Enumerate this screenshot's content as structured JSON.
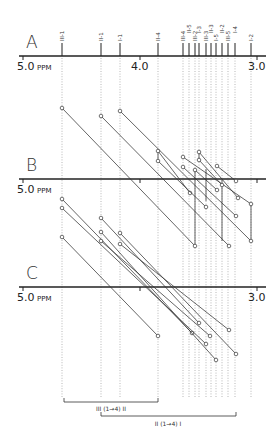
{
  "panels": [
    {
      "letter": "A",
      "axis_y": 56,
      "label_y": 48,
      "left_label": "5.0",
      "left_unit": "PPM",
      "mid_label": "4.0",
      "right_label": "3.0"
    },
    {
      "letter": "B",
      "axis_y": 179,
      "label_y": 171,
      "left_label": "5.0",
      "left_unit": "PPM",
      "mid_label": "",
      "right_label": ""
    },
    {
      "letter": "C",
      "axis_y": 287,
      "label_y": 279,
      "left_label": "5.0",
      "left_unit": "PPM",
      "mid_label": "",
      "right_label": "3.0"
    }
  ],
  "axis": {
    "x_start": 19,
    "x_end": 266,
    "ppm_5_x": 23,
    "ppm_4_x": 140,
    "ppm_3_x": 257
  },
  "peaks": [
    {
      "label": "III-1",
      "x": 62
    },
    {
      "label": "II-1",
      "x": 101
    },
    {
      "label": "I-1",
      "x": 120
    },
    {
      "label": "II-4",
      "x": 158
    },
    {
      "label": "III-4",
      "x": 183
    },
    {
      "label": "II-5",
      "x": 189
    },
    {
      "label": "III-2",
      "x": 195
    },
    {
      "label": "I-3",
      "x": 199
    },
    {
      "label": "III-3",
      "x": 206
    },
    {
      "label": "II-3",
      "x": 211
    },
    {
      "label": "I-5",
      "x": 216
    },
    {
      "label": "II-2",
      "x": 222
    },
    {
      "label": "III-5",
      "x": 228
    },
    {
      "label": "I-4",
      "x": 235
    },
    {
      "label": "I-2",
      "x": 251
    }
  ],
  "b_correlations": [
    [
      62,
      108,
      195,
      246
    ],
    [
      101,
      116,
      229,
      246
    ],
    [
      120,
      111,
      251,
      241
    ],
    [
      158,
      151,
      190,
      193
    ],
    [
      158,
      161,
      206,
      207
    ],
    [
      183,
      157,
      251,
      204
    ],
    [
      183,
      167,
      236,
      216
    ],
    [
      199,
      152,
      238,
      198
    ],
    [
      199,
      160,
      222,
      185
    ],
    [
      217,
      166,
      236,
      181
    ],
    [
      195,
      170,
      217,
      190
    ]
  ],
  "b_verticals": [
    [
      158,
      151,
      158,
      161
    ],
    [
      199,
      152,
      199,
      160
    ],
    [
      195,
      170,
      195,
      246
    ],
    [
      206,
      169,
      206,
      201
    ],
    [
      222,
      180,
      222,
      241
    ],
    [
      251,
      204,
      251,
      241
    ]
  ],
  "c_correlations": [
    [
      62,
      199,
      192,
      333
    ],
    [
      62,
      208,
      206,
      344
    ],
    [
      62,
      237,
      158,
      336
    ],
    [
      101,
      218,
      199,
      323
    ],
    [
      101,
      232,
      216,
      360
    ],
    [
      101,
      241,
      210,
      336
    ],
    [
      120,
      233,
      236,
      354
    ],
    [
      120,
      244,
      229,
      330
    ]
  ],
  "guide_bottom": 398,
  "brackets": [
    {
      "label": "III (1→4) II",
      "x1": 64,
      "x2": 158,
      "y": 402,
      "label_x": 111,
      "label_y": 411
    },
    {
      "label": "II (1→4) I",
      "x1": 101,
      "x2": 236,
      "y": 416,
      "label_x": 168,
      "label_y": 426
    }
  ]
}
